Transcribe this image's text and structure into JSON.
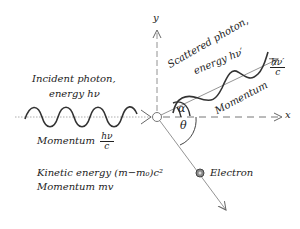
{
  "diagram": {
    "axes": {
      "x_label": "x",
      "y_label": "y"
    },
    "incident": {
      "label_line1": "Incident photon,",
      "label_line2": "energy hν",
      "momentum_word": "Momentum",
      "momentum_num": "hν",
      "momentum_den": "c"
    },
    "scattered": {
      "label_line1": "Scattered photon,",
      "label_line2": "energy hν′",
      "momentum_word": "Momentum",
      "momentum_num": "hν′",
      "momentum_den": "c"
    },
    "angles": {
      "alpha": "α",
      "theta": "θ"
    },
    "electron": {
      "label": "Electron",
      "kinetic_energy": "Kinetic energy (m−m₀)c²",
      "momentum": "Momentum mv"
    },
    "colors": {
      "ink": "#222222",
      "line": "#888888",
      "background": "#ffffff"
    }
  }
}
